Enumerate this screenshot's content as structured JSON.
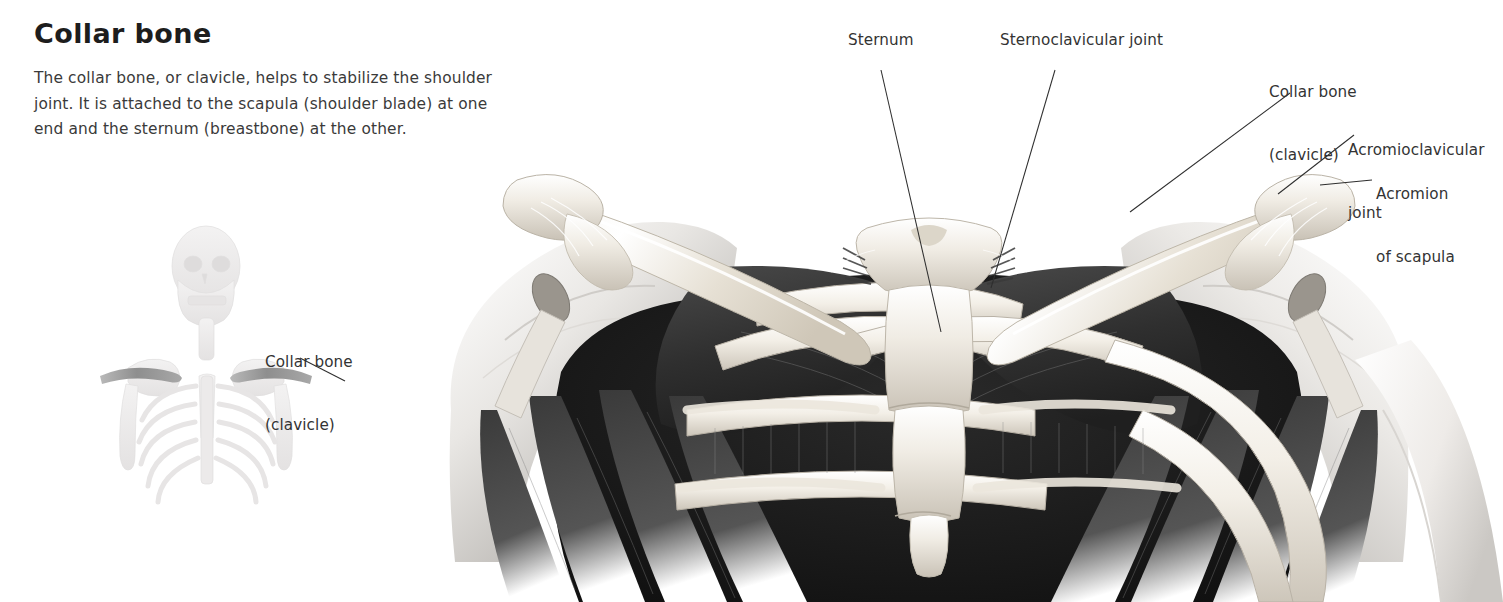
{
  "heading": "Collar bone",
  "body_text": "The collar bone, or clavicle, helps to stabilize the shoulder joint. It is attached to the scapula (shoulder blade) at one end and the sternum (breastbone) at the other.",
  "labels": {
    "thumbnail_clavicle_line1": "Collar bone",
    "thumbnail_clavicle_line2": "(clavicle)",
    "sternum": "Sternum",
    "sternoclavicular_joint": "Sternoclavicular joint",
    "collar_bone_line1": "Collar bone",
    "collar_bone_line2": "(clavicle)",
    "acromioclavicular_joint_line1": "Acromioclavicular",
    "acromioclavicular_joint_line2": "joint",
    "acromion_line1": "Acromion",
    "acromion_line2": "of scapula"
  },
  "colors": {
    "background": "#ffffff",
    "heading_text": "#1d1d1d",
    "body_text": "#3a3a3a",
    "label_text": "#333333",
    "leader_line": "#2e2e2e",
    "bone_light": "#f2efe9",
    "bone_mid": "#cfc8bd",
    "muscle_dark": "#3b3b3b",
    "muscle_deep": "#262626",
    "skin_light": "#e8e6e3",
    "thumbnail_skeleton": "#eceaea",
    "thumbnail_clavicle_highlight": "#9b9b9b"
  },
  "figure": {
    "type": "anatomical-illustration",
    "style": "grayscale airbrush medical illustration",
    "thumbnail_subject": "Full upper-body skeleton, anterior view, clavicles highlighted"
  }
}
